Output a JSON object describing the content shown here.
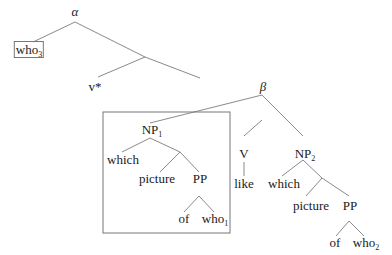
{
  "diagram": {
    "type": "syntax-tree",
    "nodes": {
      "alpha": {
        "label": "α"
      },
      "who3": {
        "label": "who",
        "sub": "3",
        "boxed": true
      },
      "vstar": {
        "label": "v*"
      },
      "beta": {
        "label": "β"
      },
      "np1": {
        "label": "NP",
        "sub": "1"
      },
      "np1_which": {
        "label": "which"
      },
      "np1_picture": {
        "label": "picture"
      },
      "np1_pp": {
        "label": "PP"
      },
      "np1_of": {
        "label": "of"
      },
      "who1": {
        "label": "who",
        "sub": "1"
      },
      "v": {
        "label": "V"
      },
      "like": {
        "label": "like"
      },
      "np2": {
        "label": "NP",
        "sub": "2"
      },
      "np2_which": {
        "label": "which"
      },
      "np2_picture": {
        "label": "picture"
      },
      "np2_pp": {
        "label": "PP"
      },
      "np2_of": {
        "label": "of"
      },
      "who2": {
        "label": "who",
        "sub": "2"
      }
    },
    "boxed_subtree": "np1",
    "colors": {
      "line": "#8a8a8a",
      "text": "#1a1a1a",
      "box": "#777777"
    }
  }
}
